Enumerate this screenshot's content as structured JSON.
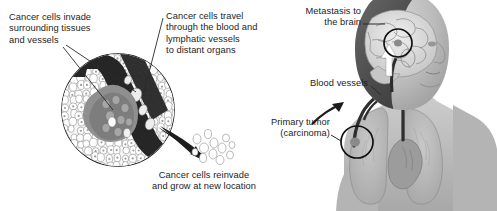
{
  "figure": {
    "background_color": "#ffffff",
    "text_color": "#1d1d1d",
    "labels": {
      "invade": "Cancer cells invade\nsurrounding tissues\nand vessels",
      "travel": "Cancer cells travel\nthrough the blood and\nlymphatic vessels\nto distant organs",
      "metastasis": "Metastasis to\nthe brain",
      "blood_vessels": "Blood vessels",
      "primary_tumor": "Primary tumor\n(carcinoma)",
      "reinvade": "Cancer cells reinvade\nand grow at new location"
    },
    "inset": {
      "name": "tissue-microscopy-circle",
      "vessel_color": "#2b2b2b",
      "tumor_color": "#8d8d8d",
      "cell_outline_color": "#8a8a8a"
    },
    "body": {
      "name": "female-figure-profile",
      "skin_tone": "#b9b9b9",
      "vessel_color": "#2e2e2e",
      "brain_marker": "metastasis-circle",
      "lung_marker": "primary-tumor-circle"
    }
  }
}
